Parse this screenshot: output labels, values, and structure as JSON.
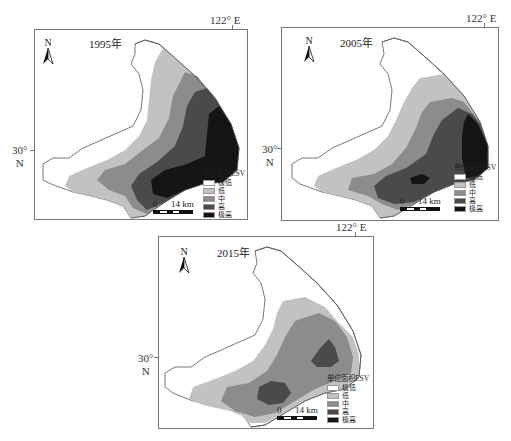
{
  "figure": {
    "legend": {
      "title": "单位面积ESV",
      "classes": [
        {
          "label": "极低",
          "color": "#ffffff"
        },
        {
          "label": "低",
          "color": "#c2c2c2"
        },
        {
          "label": "中",
          "color": "#8c8c8c"
        },
        {
          "label": "高",
          "color": "#4a4a4a"
        },
        {
          "label": "极高",
          "color": "#141414"
        }
      ]
    },
    "scale_bar": {
      "start": "0",
      "end": "14 km"
    },
    "north_arrow": {
      "label": "N"
    },
    "coordinates": {
      "longitude": "122° E",
      "latitude_deg": "30°",
      "latitude_hemi": "N"
    },
    "panels": [
      {
        "year": "1995年",
        "dominant_classes": [
          "低",
          "中",
          "高",
          "极高"
        ]
      },
      {
        "year": "2005年",
        "dominant_classes": [
          "低",
          "中",
          "高",
          "极高"
        ]
      },
      {
        "year": "2015年",
        "dominant_classes": [
          "低",
          "中",
          "高"
        ]
      }
    ]
  }
}
